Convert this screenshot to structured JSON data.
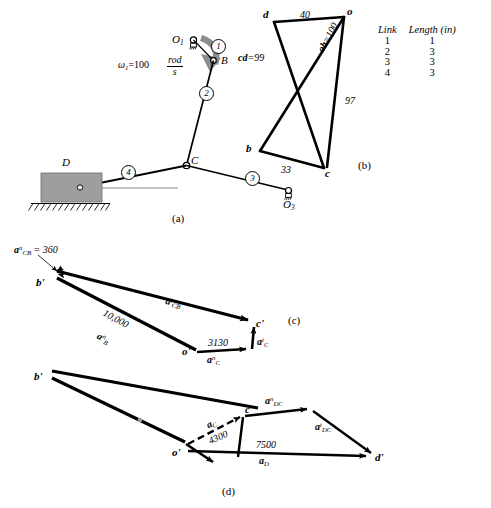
{
  "figure": {
    "caption_a": "(a)",
    "caption_b": "(b)",
    "caption_c": "(c)",
    "caption_d": "(d)"
  },
  "legend": {
    "col_link": "Link",
    "col_length": "Length (in)",
    "rows": [
      {
        "link": "1",
        "length": "1"
      },
      {
        "link": "2",
        "length": "3"
      },
      {
        "link": "3",
        "length": "3"
      },
      {
        "link": "4",
        "length": "3"
      }
    ]
  },
  "mechanism": {
    "omega_symbol": "ω",
    "omega_sub": "1",
    "omega_value": "=100",
    "unit_num": "rod",
    "unit_den": "s",
    "joint_O1": "O",
    "joint_O1_sub": "1",
    "joint_O3": "O",
    "joint_O3_sub": "3",
    "point_B": "B",
    "point_C": "C",
    "slider_D": "D",
    "link_1": "1",
    "link_2": "2",
    "link_3": "3",
    "link_4": "4"
  },
  "velocity_polygon": {
    "node_d": "d",
    "node_o": "o",
    "node_b": "b",
    "node_c": "c",
    "edge_do": "40",
    "edge_cd": "cd",
    "edge_cd_value": "=99",
    "edge_ob": "ob",
    "edge_ob_value": "=100",
    "edge_oc": "97",
    "edge_bc": "33"
  },
  "accel_polygon_c": {
    "label_an_CB": "a",
    "label_an_CB_sup": "n",
    "label_an_CB_sub": "CB",
    "label_an_CB_value": "= 360",
    "node_bp": "b'",
    "node_cp": "c'",
    "node_op": "o'",
    "label_at_CB": "a",
    "label_at_CB_sup": "t",
    "label_at_CB_sub": "CB",
    "label_an_B_value": "10,000",
    "label_an_B": "a",
    "label_an_B_sup": "n",
    "label_an_B_sub": "B",
    "label_an_C_value": "3130",
    "label_an_C": "a",
    "label_an_C_sup": "n",
    "label_an_C_sub": "C",
    "label_at_C": "a",
    "label_at_C_sup": "t",
    "label_at_C_sub": "C"
  },
  "accel_polygon_d": {
    "node_bp": "b'",
    "node_cp": "c'",
    "node_op": "o'",
    "node_dp": "d'",
    "label_aC": "a",
    "label_aC_sub": "C",
    "label_aC_value": "4300",
    "label_an_DC": "a",
    "label_an_DC_sup": "n",
    "label_an_DC_sub": "DC",
    "label_at_DC": "a",
    "label_at_DC_sup": "t",
    "label_at_DC_sub": "DC",
    "label_aD_value": "7500",
    "label_aD": "a",
    "label_aD_sub": "D"
  },
  "colors": {
    "ink": "#000000",
    "slider_fill": "#9e9e9e",
    "arrow_gray": "#8c8c8c",
    "guide_gray": "#8a8a8a"
  }
}
